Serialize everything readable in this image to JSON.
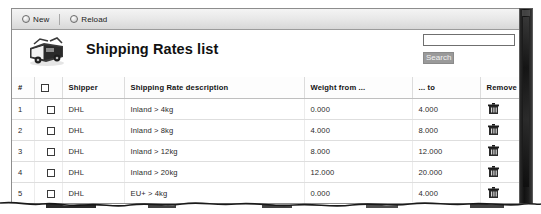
{
  "toolbar": {
    "new_label": "New",
    "reload_label": "Reload",
    "new_icon": "circle-plus-icon",
    "reload_icon": "circle-refresh-icon"
  },
  "header": {
    "title": "Shipping Rates list",
    "icon": "package-delivery-icon"
  },
  "search": {
    "value": "",
    "placeholder": "",
    "button_label": "Search"
  },
  "table": {
    "columns": [
      {
        "key": "num",
        "label": "#"
      },
      {
        "key": "check",
        "label": ""
      },
      {
        "key": "shipper",
        "label": "Shipper"
      },
      {
        "key": "description",
        "label": "Shipping Rate description"
      },
      {
        "key": "weight_from",
        "label": "Weight from ..."
      },
      {
        "key": "weight_to",
        "label": "... to"
      },
      {
        "key": "remove",
        "label": "Remove"
      }
    ],
    "rows": [
      {
        "num": "1",
        "shipper": "DHL",
        "description": "Inland > 4kg",
        "weight_from": "0.000",
        "weight_to": "4.000",
        "remove_icon": "delete-icon"
      },
      {
        "num": "2",
        "shipper": "DHL",
        "description": "Inland > 8kg",
        "weight_from": "4.000",
        "weight_to": "8.000",
        "remove_icon": "delete-icon"
      },
      {
        "num": "3",
        "shipper": "DHL",
        "description": "Inland > 12kg",
        "weight_from": "8.000",
        "weight_to": "12.000",
        "remove_icon": "delete-icon"
      },
      {
        "num": "4",
        "shipper": "DHL",
        "description": "Inland > 20kg",
        "weight_from": "12.000",
        "weight_to": "20.000",
        "remove_icon": "delete-icon"
      },
      {
        "num": "5",
        "shipper": "DHL",
        "description": "EU+ > 4kg",
        "weight_from": "0.000",
        "weight_to": "4.000",
        "remove_icon": "delete-icon"
      }
    ]
  },
  "colors": {
    "toolbar_top": "#f4f4f4",
    "toolbar_bottom": "#d8d8d8",
    "border": "#8d8d8d",
    "text": "#1e1e1e",
    "search_button_bg": "#9a9a9a",
    "scrollbar": "#111111"
  }
}
